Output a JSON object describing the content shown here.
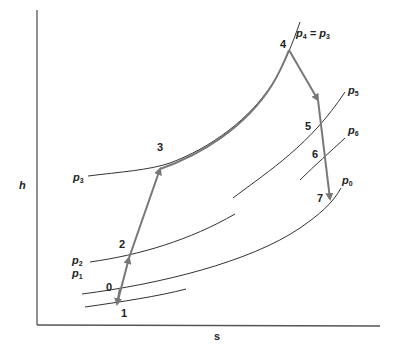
{
  "diagram": {
    "type": "h-s diagram (thermodynamic cycle)",
    "axes": {
      "y_label": "h",
      "x_label": "s"
    },
    "isobars": [
      {
        "id": "p3",
        "label": "p",
        "sub": "3"
      },
      {
        "id": "p4",
        "label_main": "p",
        "sub4": "4",
        "equals": " = ",
        "label_main2": "p",
        "sub3": "3"
      },
      {
        "id": "p5",
        "label": "p",
        "sub": "5"
      },
      {
        "id": "p6",
        "label": "p",
        "sub": "6"
      },
      {
        "id": "p0",
        "label": "p",
        "sub": "0"
      },
      {
        "id": "p2",
        "label": "p",
        "sub": "2"
      },
      {
        "id": "p1",
        "label": "p",
        "sub": "1"
      }
    ],
    "states": [
      {
        "id": "0",
        "label": "0"
      },
      {
        "id": "1",
        "label": "1"
      },
      {
        "id": "2",
        "label": "2"
      },
      {
        "id": "3",
        "label": "3"
      },
      {
        "id": "4",
        "label": "4"
      },
      {
        "id": "5",
        "label": "5"
      },
      {
        "id": "6",
        "label": "6"
      },
      {
        "id": "7",
        "label": "7"
      }
    ],
    "processes": [
      "0→1",
      "1→2",
      "2→3",
      "3→4",
      "4→5",
      "5→6",
      "6→7"
    ],
    "colors": {
      "process_line": "#777777",
      "isobar": "#333333",
      "axis": "#555555",
      "text": "#222222"
    }
  }
}
